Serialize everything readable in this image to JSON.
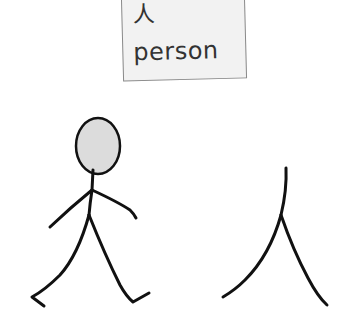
{
  "card": {
    "character": "人",
    "meaning": "person"
  },
  "illustrations": {
    "left": "stick-figure-walking",
    "right": "ren-character-strokes"
  },
  "colors": {
    "ink": "#111111",
    "head_fill": "#dcdcdc",
    "card_bg": "#f2f2f2",
    "card_border": "#8a8a8a"
  }
}
